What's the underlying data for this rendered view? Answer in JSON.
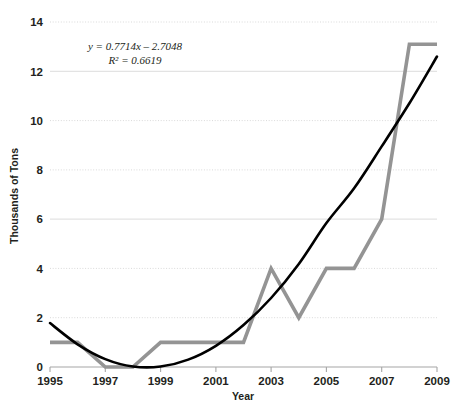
{
  "chart_data": {
    "type": "line",
    "title": "",
    "xlabel": "Year",
    "ylabel": "Thousands of Tons",
    "xlim": [
      1995,
      2009
    ],
    "ylim": [
      0,
      14
    ],
    "grid": true,
    "legend": "none",
    "x": [
      1995,
      1996,
      1997,
      1998,
      1999,
      2000,
      2001,
      2002,
      2003,
      2004,
      2005,
      2006,
      2007,
      2008,
      2009
    ],
    "xtick_labels": [
      "1995",
      "1997",
      "1999",
      "2001",
      "2003",
      "2005",
      "2007",
      "2009"
    ],
    "xticks": [
      1995,
      1997,
      1999,
      2001,
      2003,
      2005,
      2007,
      2009
    ],
    "ytick_labels": [
      "0",
      "2",
      "4",
      "6",
      "8",
      "10",
      "12",
      "14"
    ],
    "yticks": [
      0,
      2,
      4,
      6,
      8,
      10,
      12,
      14
    ],
    "series": [
      {
        "name": "Tonnage",
        "type": "line",
        "color": "#949494",
        "width": 3.6,
        "values": [
          1,
          1,
          0,
          0,
          1,
          1,
          1,
          1,
          4,
          2,
          4,
          4,
          6,
          13.1,
          13.1
        ]
      },
      {
        "name": "Trendline",
        "type": "trend",
        "color": "#000000",
        "width": 2.6,
        "values": [
          1.78,
          0.92,
          0.32,
          0.02,
          0.02,
          0.3,
          0.86,
          1.7,
          2.8,
          4.18,
          5.84,
          7.25,
          8.95,
          10.7,
          12.6
        ]
      }
    ],
    "annotations": [
      {
        "name": "regression-equation",
        "text": "y = 0.7714x – 2.7048"
      },
      {
        "name": "r-squared",
        "text": "R² = 0.6619"
      }
    ],
    "colors": {
      "series_gray": "#949494",
      "trendline": "#000000",
      "gridline": "#d9d9d9",
      "axis": "#a6a6a6",
      "text": "#231f20",
      "background": "#ffffff"
    }
  }
}
